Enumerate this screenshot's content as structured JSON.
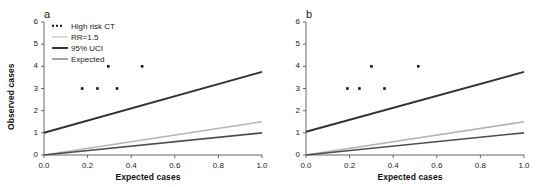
{
  "figure": {
    "width": 537,
    "height": 187,
    "background": "#ffffff"
  },
  "chart_data": [
    {
      "id": "panel-a",
      "type": "scatter",
      "title": "a",
      "xlabel": "Expected cases",
      "ylabel": "Observed cases",
      "xlim": [
        0.0,
        1.0
      ],
      "ylim": [
        0,
        6
      ],
      "xticks": [
        0.0,
        0.2,
        0.4,
        0.6,
        0.8,
        1.0
      ],
      "xticklabels": [
        "0.0",
        "0.2",
        "0.4",
        "0.6",
        "0.8",
        "1.0"
      ],
      "yticks": [
        0,
        1,
        2,
        3,
        4,
        5,
        6
      ],
      "yticklabels": [
        "0",
        "1",
        "2",
        "3",
        "4",
        "5",
        "6"
      ],
      "grid": false,
      "legend_position": "upper left",
      "points": [
        {
          "x": 0.175,
          "y": 3
        },
        {
          "x": 0.245,
          "y": 3
        },
        {
          "x": 0.295,
          "y": 4
        },
        {
          "x": 0.335,
          "y": 3
        },
        {
          "x": 0.45,
          "y": 4
        }
      ],
      "lines": [
        {
          "name": "95% UCI",
          "color": "#333333",
          "width": 2.0,
          "x": [
            0.0,
            1.0
          ],
          "y": [
            1.0,
            3.75
          ]
        },
        {
          "name": "RR=1.5",
          "color": "#b4b4b4",
          "width": 1.6,
          "x": [
            0.0,
            1.0
          ],
          "y": [
            0.0,
            1.5
          ]
        },
        {
          "name": "Expected",
          "color": "#4d4d4d",
          "width": 1.6,
          "x": [
            0.0,
            1.0
          ],
          "y": [
            0.0,
            1.0
          ]
        }
      ],
      "legend": [
        {
          "label": "High risk CT",
          "marker": "dots",
          "color": "#111111"
        },
        {
          "label": "RR=1.5",
          "marker": "line",
          "color": "#b4b4b4"
        },
        {
          "label": "95% UCI",
          "marker": "line",
          "color": "#333333"
        },
        {
          "label": "Expected",
          "marker": "line",
          "color": "#4d4d4d"
        }
      ]
    },
    {
      "id": "panel-b",
      "type": "scatter",
      "title": "b",
      "xlabel": "Expected cases",
      "ylabel": "",
      "xlim": [
        0.0,
        1.0
      ],
      "ylim": [
        0,
        6
      ],
      "xticks": [
        0.0,
        0.2,
        0.4,
        0.6,
        0.8,
        1.0
      ],
      "xticklabels": [
        "0.0",
        "0.2",
        "0.4",
        "0.6",
        "0.8",
        "1.0"
      ],
      "yticks": [
        0,
        1,
        2,
        3,
        4,
        5,
        6
      ],
      "yticklabels": [
        "0",
        "1",
        "2",
        "3",
        "4",
        "5",
        "6"
      ],
      "grid": false,
      "legend_position": "none",
      "points": [
        {
          "x": 0.19,
          "y": 3
        },
        {
          "x": 0.245,
          "y": 3
        },
        {
          "x": 0.3,
          "y": 4
        },
        {
          "x": 0.36,
          "y": 3
        },
        {
          "x": 0.515,
          "y": 4
        }
      ],
      "lines": [
        {
          "name": "95% UCI",
          "color": "#333333",
          "width": 2.0,
          "x": [
            0.0,
            1.0
          ],
          "y": [
            1.05,
            3.75
          ]
        },
        {
          "name": "RR=1.5",
          "color": "#b4b4b4",
          "width": 1.6,
          "x": [
            0.0,
            1.0
          ],
          "y": [
            0.0,
            1.5
          ]
        },
        {
          "name": "Expected",
          "color": "#4d4d4d",
          "width": 1.6,
          "x": [
            0.0,
            1.0
          ],
          "y": [
            0.0,
            1.0
          ]
        }
      ],
      "legend": []
    }
  ],
  "style": {
    "axis_color": "#555555",
    "tick_color": "#555555",
    "point_color": "#111111",
    "text_color": "#1a1a1a"
  }
}
